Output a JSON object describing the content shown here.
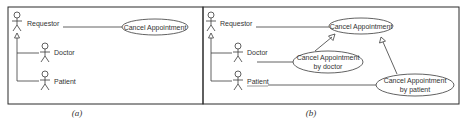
{
  "panels": [
    {
      "caption": "(a)",
      "actors": [
        {
          "name": "Requestor"
        },
        {
          "name": "Doctor"
        },
        {
          "name": "Patient"
        }
      ],
      "use_cases": [
        {
          "label": "Cancel Appointment"
        }
      ]
    },
    {
      "caption": "(b)",
      "actors": [
        {
          "name": "Requestor"
        },
        {
          "name": "Doctor"
        },
        {
          "name": "Patient"
        }
      ],
      "use_cases": [
        {
          "label": "Cancel Appointment"
        },
        {
          "line1": "Cancel Appointment",
          "line2": "by doctor"
        },
        {
          "line1": "Cancel Appointment",
          "line2": "by patient"
        }
      ]
    }
  ],
  "colors": {
    "line": "#3a3a3a",
    "text": "#333333",
    "background": "#ffffff"
  }
}
